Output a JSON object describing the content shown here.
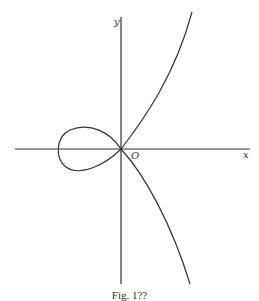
{
  "figure": {
    "axis_labels": {
      "x": "x",
      "y": "y",
      "origin": "O"
    },
    "caption": "Fig. 1??",
    "curve": {
      "description": "Nodal cubic with a loop on the negative x side, passing through the origin; one branch rising to upper right, the other descending to lower right",
      "stroke_color": "#333333"
    },
    "axes_color": "#333333"
  }
}
